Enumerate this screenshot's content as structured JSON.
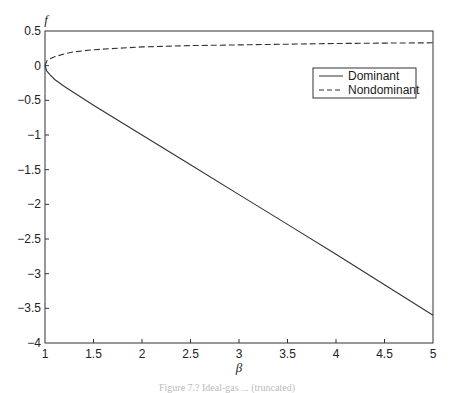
{
  "chart_data": {
    "type": "line",
    "title": "",
    "xlabel": "β",
    "ylabel": "f",
    "xlim": [
      1,
      5
    ],
    "ylim": [
      -4,
      0.5
    ],
    "xticks": [
      1,
      1.5,
      2,
      2.5,
      3,
      3.5,
      4,
      4.5,
      5
    ],
    "xtick_labels": [
      "1",
      "1.5",
      "2",
      "2.5",
      "3",
      "3.5",
      "4",
      "4.5",
      "5"
    ],
    "yticks": [
      0.5,
      0,
      -0.5,
      -1,
      -1.5,
      -2,
      -2.5,
      -3,
      -3.5,
      -4
    ],
    "ytick_labels": [
      "0.5",
      "0",
      "−0.5",
      "−1",
      "−1.5",
      "−2",
      "−2.5",
      "−3",
      "−3.5",
      "−4"
    ],
    "grid": false,
    "legend_position": "upper right (inset)",
    "x": [
      1,
      1.02,
      1.05,
      1.1,
      1.2,
      1.3,
      1.5,
      2,
      2.5,
      3,
      3.5,
      4,
      4.5,
      5
    ],
    "series": [
      {
        "name": "Dominant",
        "style": "solid",
        "values": [
          0,
          -0.08,
          -0.13,
          -0.2,
          -0.3,
          -0.39,
          -0.57,
          -1.0,
          -1.43,
          -1.86,
          -2.29,
          -2.72,
          -3.16,
          -3.6
        ]
      },
      {
        "name": "Nondominant",
        "style": "dashed",
        "values": [
          0,
          0.07,
          0.1,
          0.13,
          0.17,
          0.2,
          0.23,
          0.27,
          0.29,
          0.3,
          0.31,
          0.32,
          0.325,
          0.33
        ]
      }
    ]
  },
  "legend": {
    "items": [
      {
        "label": "Dominant",
        "style": "solid"
      },
      {
        "label": "Nondominant",
        "style": "dashed"
      }
    ]
  },
  "axes": {
    "xlabel": "β",
    "ylabel": "f"
  },
  "caption": "Figure 7.?  Ideal-gas ... (truncated)"
}
